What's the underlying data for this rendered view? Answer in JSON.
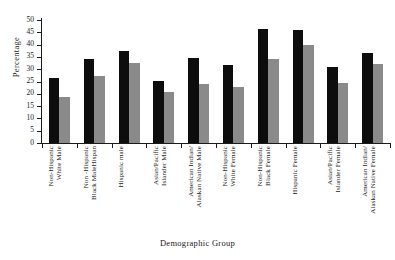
{
  "chart_data": {
    "type": "bar",
    "title": "",
    "xlabel": "Demographic Group",
    "ylabel": "Percentage",
    "ylim": [
      0,
      50
    ],
    "yticks": [
      0,
      5,
      10,
      15,
      20,
      25,
      30,
      35,
      40,
      45,
      50
    ],
    "grid": false,
    "legend": "none",
    "categories": [
      "Non-Hispanic\nWhite Male",
      "Non -Hispanic\nBlack MaleHispan",
      "Hispanic male",
      "Asian/Pacific\nIslander Male",
      "American Indian/\nAlaskan Native Male",
      "Non-Hispanic\nWhite Female",
      "Non-Hispanic\nBlack Female",
      "Hispanic Female",
      "Asian/Pacific\nIslander Female",
      "American Indian/\nAlaskan Native Female"
    ],
    "series": [
      {
        "name": "dark",
        "color": "#0d0d0d",
        "values": [
          26.4,
          34.3,
          37.6,
          25.1,
          34.6,
          31.6,
          46.2,
          45.8,
          30.8,
          36.6
        ]
      },
      {
        "name": "light",
        "color": "#8a8a8a",
        "values": [
          18.7,
          27.2,
          32.7,
          20.6,
          24.0,
          22.6,
          34.3,
          40.0,
          24.3,
          32.2
        ]
      }
    ]
  }
}
